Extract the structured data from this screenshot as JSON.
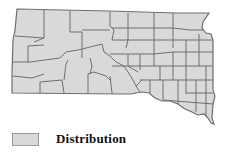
{
  "map": {
    "region": "South Dakota counties",
    "fill_color": "#d9d9d9",
    "border_color": "#6e6e6e"
  },
  "legend": {
    "items": [
      {
        "label": "Distribution",
        "color": "#d9d9d9"
      }
    ]
  }
}
